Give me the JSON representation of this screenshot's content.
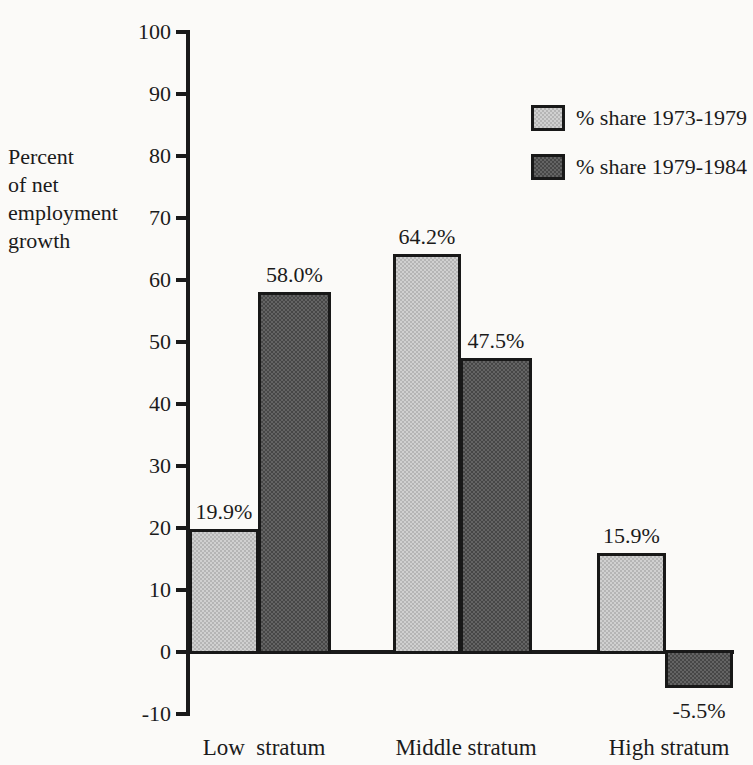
{
  "figure": {
    "background": "#fbfaf8",
    "ink_color": "#1a1a1a"
  },
  "chart_data": {
    "type": "bar",
    "title": "",
    "y_axis_label": "Percent\nof net\nemployment\ngrowth",
    "ylim": [
      -10,
      100
    ],
    "ytick_step": 10,
    "yticks": [
      100,
      90,
      80,
      70,
      60,
      50,
      40,
      30,
      20,
      10,
      0,
      -10
    ],
    "grid": "off",
    "legend_position": "top-right",
    "categories": [
      "Low  stratum",
      "Middle stratum",
      "High stratum"
    ],
    "series": [
      {
        "name": "% share 1973-1979",
        "color": "#c9c9c9",
        "values": [
          19.9,
          64.2,
          15.9
        ],
        "value_labels": [
          "19.9%",
          "64.2%",
          "15.9%"
        ]
      },
      {
        "name": "% share 1979-1984",
        "color": "#4f4f4f",
        "values": [
          58.0,
          47.5,
          -5.5
        ],
        "value_labels": [
          "58.0%",
          "47.5%",
          "-5.5%"
        ]
      }
    ]
  }
}
